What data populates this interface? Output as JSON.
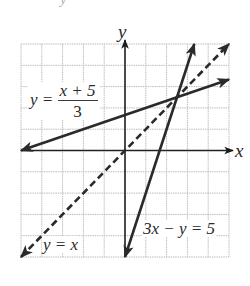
{
  "figure": {
    "top_cut_text": "y",
    "grid": {
      "x_min": -5,
      "x_max": 5,
      "y_min": -5,
      "y_max": 5,
      "cells_x": 10,
      "cells_y": 10,
      "line_color": "#bdbdbd",
      "axis_color": "#222222"
    },
    "axes": {
      "x_label": "x",
      "y_label": "y"
    },
    "lines": [
      {
        "name": "y = (x+5)/3",
        "style": "solid",
        "from": [
          -5,
          0
        ],
        "to": [
          5,
          3.333
        ],
        "arrows": "both"
      },
      {
        "name": "3x - y = 5",
        "style": "solid",
        "from": [
          0,
          -5
        ],
        "to": [
          3.333,
          5
        ],
        "arrows": "both"
      },
      {
        "name": "y = x",
        "style": "dashed",
        "from": [
          -5,
          -5
        ],
        "to": [
          5,
          5
        ],
        "arrows": "both"
      }
    ],
    "intersection": [
      2.5,
      2.5
    ],
    "labels": {
      "line1_lhs": "y =",
      "line1_num": "x + 5",
      "line1_den": "3",
      "line2": "3x − y = 5",
      "line3": "y = x"
    }
  }
}
